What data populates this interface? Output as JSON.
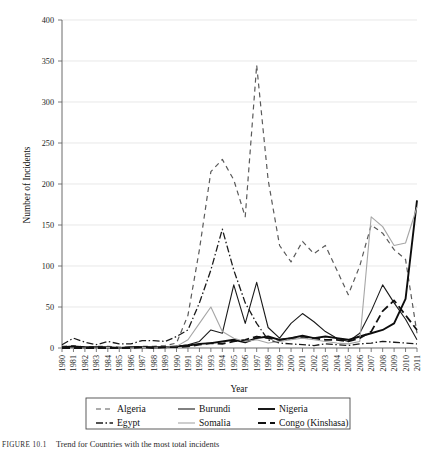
{
  "figure": {
    "caption_tag": "FIGURE 10.1",
    "caption_text": "Trend for Countries with the most total incidents"
  },
  "chart_data": {
    "type": "line",
    "title": "",
    "xlabel": "Year",
    "ylabel": "Number of Incidents",
    "xlim": [
      1980,
      2011
    ],
    "ylim": [
      0,
      400
    ],
    "ytick_values": [
      0,
      50,
      100,
      150,
      200,
      250,
      300,
      350,
      400
    ],
    "ytick_labels": [
      "0",
      "50",
      "100",
      "150",
      "200",
      "250",
      "300",
      "350",
      "400"
    ],
    "grid": true,
    "legend_position": "below-axes",
    "x": [
      1980,
      1981,
      1982,
      1983,
      1984,
      1985,
      1986,
      1987,
      1988,
      1989,
      1990,
      1991,
      1992,
      1993,
      1994,
      1995,
      1996,
      1997,
      1998,
      1999,
      2000,
      2001,
      2002,
      2003,
      2004,
      2005,
      2006,
      2007,
      2008,
      2009,
      2010,
      2011
    ],
    "xtick_labels": [
      "1980",
      "1981",
      "1982",
      "1983",
      "1984",
      "1985",
      "1986",
      "1987",
      "1988",
      "1989",
      "1990",
      "1991",
      "1992",
      "1993",
      "1994",
      "1995",
      "1996",
      "1997",
      "1998",
      "1999",
      "2000",
      "2001",
      "2002",
      "2003",
      "2004",
      "2005",
      "2006",
      "2007",
      "2008",
      "2009",
      "2010",
      "2011"
    ],
    "series": [
      {
        "name": "Algeria",
        "style": "dashed",
        "color": "#5a5a5a",
        "width": 1.2,
        "dash": "5,4",
        "values": [
          2,
          3,
          1,
          2,
          2,
          1,
          1,
          2,
          2,
          3,
          6,
          40,
          120,
          215,
          230,
          205,
          160,
          345,
          205,
          125,
          105,
          130,
          115,
          125,
          95,
          65,
          100,
          150,
          140,
          120,
          108,
          18
        ]
      },
      {
        "name": "Burundi",
        "style": "solid",
        "color": "#1a1a1a",
        "width": 1.1,
        "dash": "",
        "values": [
          0,
          1,
          0,
          1,
          1,
          0,
          1,
          1,
          0,
          1,
          2,
          4,
          8,
          22,
          18,
          77,
          30,
          80,
          25,
          12,
          30,
          42,
          32,
          20,
          12,
          8,
          18,
          45,
          77,
          55,
          35,
          10
        ]
      },
      {
        "name": "Nigeria",
        "style": "solid-bold",
        "color": "#0d0d0d",
        "width": 1.9,
        "dash": "",
        "values": [
          1,
          2,
          1,
          1,
          1,
          0,
          1,
          1,
          1,
          1,
          2,
          3,
          5,
          6,
          8,
          10,
          7,
          12,
          14,
          10,
          12,
          15,
          12,
          14,
          12,
          10,
          14,
          18,
          22,
          30,
          60,
          180
        ]
      },
      {
        "name": "Egypt",
        "style": "dash-dot",
        "color": "#1a1a1a",
        "width": 1.3,
        "dash": "7,2.5,1.5,2.5",
        "values": [
          4,
          12,
          7,
          4,
          8,
          5,
          5,
          9,
          9,
          8,
          14,
          22,
          55,
          95,
          145,
          95,
          55,
          30,
          10,
          6,
          5,
          4,
          3,
          5,
          4,
          3,
          5,
          6,
          8,
          7,
          6,
          5
        ]
      },
      {
        "name": "Somalia",
        "style": "solid-light",
        "color": "#a6a6a6",
        "width": 1.1,
        "dash": "",
        "values": [
          0,
          0,
          0,
          0,
          1,
          0,
          0,
          1,
          0,
          1,
          2,
          10,
          30,
          50,
          20,
          12,
          8,
          10,
          6,
          8,
          10,
          12,
          10,
          8,
          6,
          5,
          8,
          160,
          148,
          125,
          128,
          172
        ]
      },
      {
        "name": "Congo (Kinshasa)",
        "style": "long-dash",
        "color": "#111111",
        "width": 1.8,
        "dash": "8,4",
        "values": [
          0,
          0,
          0,
          0,
          0,
          0,
          0,
          1,
          0,
          1,
          1,
          2,
          4,
          6,
          5,
          8,
          10,
          14,
          12,
          10,
          12,
          14,
          12,
          10,
          10,
          8,
          12,
          20,
          45,
          58,
          40,
          22
        ]
      }
    ]
  },
  "legend": {
    "entries": [
      {
        "label": "Algeria"
      },
      {
        "label": "Burundi"
      },
      {
        "label": "Nigeria"
      },
      {
        "label": "Egypt"
      },
      {
        "label": "Somalia"
      },
      {
        "label": "Congo (Kinshasa)"
      }
    ]
  }
}
